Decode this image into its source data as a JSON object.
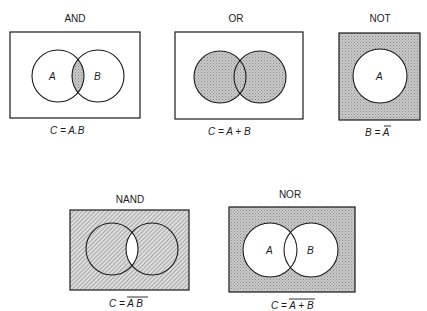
{
  "diagram": {
    "type": "venn-logic-gates",
    "panels": [
      {
        "id": "and",
        "title": "AND",
        "circle_labels": [
          "A",
          "B"
        ],
        "shaded_region": "A∩B",
        "equation": {
          "prefix": "C = ",
          "expr": "A.B",
          "overbar": ""
        }
      },
      {
        "id": "or",
        "title": "OR",
        "circle_labels": [],
        "shaded_region": "A∪B",
        "equation": {
          "prefix": "C = ",
          "expr": "A + B",
          "overbar": ""
        }
      },
      {
        "id": "not",
        "title": "NOT",
        "circle_labels": [
          "A"
        ],
        "shaded_region": "complement of A",
        "equation": {
          "prefix": "B = ",
          "expr": "",
          "overbar": "A"
        }
      },
      {
        "id": "nand",
        "title": "NAND",
        "circle_labels": [],
        "shaded_region": "complement of A∩B",
        "equation": {
          "prefix": "C = ",
          "expr": "",
          "overbar": "A B"
        }
      },
      {
        "id": "nor",
        "title": "NOR",
        "circle_labels": [
          "A",
          "B"
        ],
        "shaded_region": "complement of A∪B",
        "equation": {
          "prefix": "C = ",
          "expr": "",
          "overbar": "A + B"
        }
      }
    ],
    "colors": {
      "line": "#1a1a1a",
      "shade_dots": "#9a9a9a",
      "shade_hatch": "#7a7a7a",
      "background": "#ffffff"
    }
  }
}
